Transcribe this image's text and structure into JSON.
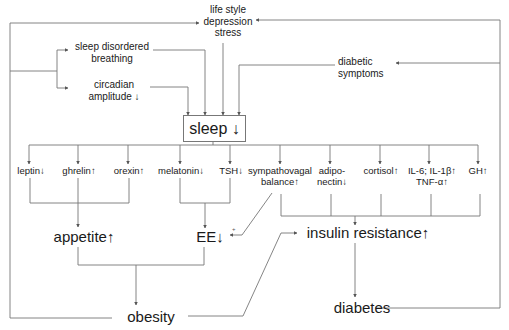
{
  "diagram": {
    "type": "flowchart",
    "nodes": {
      "lifestyle": [
        "life style",
        "depression",
        "stress"
      ],
      "sleep_disordered_breathing": [
        "sleep disordered",
        "breathing"
      ],
      "circadian_amplitude": [
        "circadian",
        "amplitude ↓"
      ],
      "diabetic_symptoms": [
        "diabetic",
        "symptoms"
      ],
      "sleep": "sleep ↓",
      "leptin": "leptin↓",
      "ghrelin": "ghrelin↑",
      "orexin": "orexin↑",
      "melatonin": "melatonin↓",
      "tsh": "TSH↓",
      "sympathovagal": [
        "sympathovagal",
        "balance↑"
      ],
      "adiponectin": [
        "adipo-",
        "nectin↓"
      ],
      "cortisol": "cortisol↑",
      "interleukins": [
        "IL-6; IL-1β↑",
        "TNF-α↑"
      ],
      "gh": "GH↑",
      "appetite": "appetite↑",
      "ee": "EE↓",
      "plus_sign": "+",
      "insulin_resistance": "insulin resistance↑",
      "obesity": "obesity",
      "diabetes": "diabetes"
    },
    "edges": [
      [
        "sleep_disordered_breathing",
        "sleep"
      ],
      [
        "circadian_amplitude",
        "sleep"
      ],
      [
        "lifestyle",
        "sleep"
      ],
      [
        "diabetic_symptoms",
        "sleep"
      ],
      [
        "sleep",
        "leptin"
      ],
      [
        "sleep",
        "ghrelin"
      ],
      [
        "sleep",
        "orexin"
      ],
      [
        "sleep",
        "melatonin"
      ],
      [
        "sleep",
        "tsh"
      ],
      [
        "sleep",
        "sympathovagal"
      ],
      [
        "sleep",
        "adiponectin"
      ],
      [
        "sleep",
        "cortisol"
      ],
      [
        "sleep",
        "interleukins"
      ],
      [
        "sleep",
        "gh"
      ],
      [
        "leptin",
        "appetite"
      ],
      [
        "ghrelin",
        "appetite"
      ],
      [
        "orexin",
        "appetite"
      ],
      [
        "melatonin",
        "ee"
      ],
      [
        "tsh",
        "ee"
      ],
      [
        "sympathovagal",
        "ee"
      ],
      [
        "sympathovagal",
        "insulin_resistance"
      ],
      [
        "adiponectin",
        "insulin_resistance"
      ],
      [
        "cortisol",
        "insulin_resistance"
      ],
      [
        "interleukins",
        "insulin_resistance"
      ],
      [
        "gh",
        "insulin_resistance"
      ],
      [
        "appetite",
        "obesity"
      ],
      [
        "ee",
        "obesity"
      ],
      [
        "obesity",
        "insulin_resistance"
      ],
      [
        "obesity",
        "sleep_disordered_breathing"
      ],
      [
        "obesity",
        "circadian_amplitude"
      ],
      [
        "insulin_resistance",
        "diabetes"
      ],
      [
        "diabetes",
        "diabetic_symptoms"
      ],
      [
        "diabetes",
        "lifestyle"
      ]
    ]
  }
}
